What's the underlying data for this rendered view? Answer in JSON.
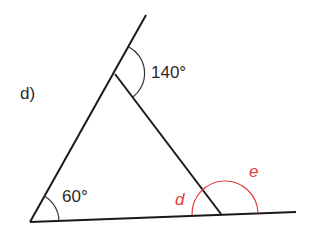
{
  "figure": {
    "part_label": "d)",
    "angles": {
      "top_exterior": "140°",
      "bottom_left": "60°",
      "unknown_interior": "d",
      "unknown_exterior": "e"
    },
    "colors": {
      "line": "#1a1a1a",
      "unknown": "#e0403a"
    }
  }
}
